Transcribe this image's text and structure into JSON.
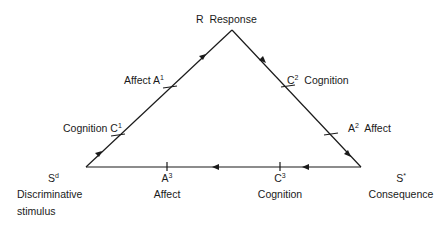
{
  "diagram": {
    "nodes": {
      "response": {
        "letter": "R",
        "label": "Response"
      },
      "discriminative": {
        "letter": "S",
        "sup": "d",
        "label1": "Discriminative",
        "label2": "stimulus"
      },
      "consequence": {
        "letter": "S",
        "sup": "*",
        "label": "Consequence"
      }
    },
    "edge_labels": {
      "a1": {
        "text": "Affect A",
        "sup": "1"
      },
      "c1": {
        "text": "Cognition C",
        "sup": "1"
      },
      "c2": {
        "text": "C",
        "sup": "2",
        "after": "Cognition"
      },
      "a2": {
        "text": "A",
        "sup": "2",
        "after": "Affect"
      },
      "a3": {
        "text": "A",
        "sup": "3",
        "below": "Affect"
      },
      "c3": {
        "text": "C",
        "sup": "3",
        "below": "Cognition"
      }
    },
    "flow": [
      "Sd",
      "R",
      "S*",
      "Sd"
    ],
    "colors": {
      "line": "#1a1a1a",
      "background": "#ffffff"
    }
  }
}
